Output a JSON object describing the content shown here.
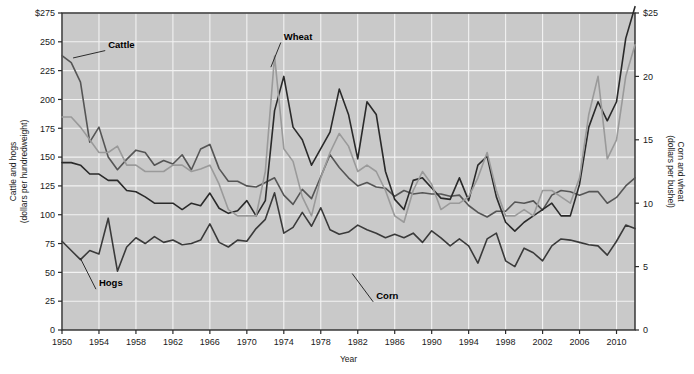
{
  "chart_data": {
    "type": "line",
    "title": "",
    "xlabel": "Year",
    "ylabel_left": "Cattle and hogs\n(dollars per hundredweight)",
    "ylabel_left_line1": "Cattle and hogs",
    "ylabel_left_line2": "(dollars per hundredweight)",
    "ylabel_right_line1": "Corn and wheat",
    "ylabel_right_line2": "(dollars per bushel)",
    "grid": true,
    "legend_position": "inline-annotations",
    "xlim": [
      1950,
      2012
    ],
    "x_ticks": [
      1950,
      1954,
      1958,
      1962,
      1966,
      1970,
      1974,
      1978,
      1982,
      1986,
      1990,
      1994,
      1998,
      2002,
      2006,
      2010
    ],
    "x_tick_labels": [
      "1950",
      "1954",
      "1958",
      "1962",
      "1966",
      "1970",
      "1974",
      "1978",
      "1982",
      "1986",
      "1990",
      "1994",
      "1998",
      "2002",
      "2006",
      "2010"
    ],
    "ylim_left": [
      0,
      275
    ],
    "y_ticks_left": [
      0,
      25,
      50,
      75,
      100,
      125,
      150,
      175,
      200,
      225,
      250,
      275
    ],
    "y_tick_labels_left": [
      "0",
      "25",
      "50",
      "75",
      "100",
      "125",
      "150",
      "175",
      "200",
      "225",
      "250",
      "$275"
    ],
    "ylim_right": [
      0,
      25
    ],
    "y_ticks_right": [
      0,
      5,
      10,
      15,
      20,
      25
    ],
    "y_tick_labels_right": [
      "0",
      "5",
      "10",
      "15",
      "20",
      "$25"
    ],
    "colors": {
      "background": "#c9c9c9",
      "gridline": "#f2f2f2",
      "frame": "#2b2b2b",
      "cattle": "#555555",
      "hogs": "#3a3a3a",
      "corn": "#2a2a2a",
      "wheat": "#9a9a9a"
    },
    "x": [
      1950,
      1951,
      1952,
      1953,
      1954,
      1955,
      1956,
      1957,
      1958,
      1959,
      1960,
      1961,
      1962,
      1963,
      1964,
      1965,
      1966,
      1967,
      1968,
      1969,
      1970,
      1971,
      1972,
      1973,
      1974,
      1975,
      1976,
      1977,
      1978,
      1979,
      1980,
      1981,
      1982,
      1983,
      1984,
      1985,
      1986,
      1987,
      1988,
      1989,
      1990,
      1991,
      1992,
      1993,
      1994,
      1995,
      1996,
      1997,
      1998,
      1999,
      2000,
      2001,
      2002,
      2003,
      2004,
      2005,
      2006,
      2007,
      2008,
      2009,
      2010,
      2011,
      2012
    ],
    "series": [
      {
        "name": "Cattle",
        "axis": "left",
        "color": "#555555",
        "label_x": 1955,
        "label_y": 245,
        "values": [
          238,
          232,
          215,
          163,
          176,
          150,
          139,
          148,
          156,
          154,
          143,
          147,
          144,
          152,
          139,
          157,
          161,
          140,
          129,
          129,
          125,
          124,
          128,
          132,
          117,
          109,
          122,
          114,
          133,
          152,
          141,
          132,
          125,
          128,
          124,
          123,
          116,
          121,
          118,
          119,
          118,
          118,
          116,
          117,
          108,
          102,
          98,
          103,
          103,
          111,
          110,
          112,
          104,
          117,
          121,
          120,
          117,
          120,
          120,
          110,
          115,
          125,
          132
        ]
      },
      {
        "name": "Hogs",
        "axis": "left",
        "color": "#3a3a3a",
        "label_x": 1954,
        "label_y": 38,
        "values": [
          77,
          69,
          61,
          69,
          66,
          97,
          51,
          72,
          80,
          75,
          81,
          76,
          78,
          74,
          75,
          78,
          92,
          76,
          72,
          78,
          77,
          88,
          96,
          119,
          84,
          89,
          102,
          90,
          106,
          87,
          83,
          85,
          91,
          87,
          84,
          80,
          83,
          80,
          84,
          76,
          86,
          80,
          73,
          79,
          73,
          58,
          79,
          84,
          60,
          55,
          71,
          67,
          60,
          73,
          79,
          78,
          76,
          74,
          73,
          65,
          77,
          91,
          88
        ]
      },
      {
        "name": "Corn",
        "axis": "right",
        "color": "#2a2a2a",
        "label_x": 1984,
        "label_y": 27,
        "values": [
          13.2,
          13.2,
          13.0,
          12.3,
          12.3,
          11.8,
          11.8,
          11.0,
          10.9,
          10.5,
          10.0,
          10.0,
          10.0,
          9.5,
          10.0,
          9.8,
          10.8,
          9.6,
          9.2,
          9.4,
          10.2,
          9.0,
          10.2,
          17.3,
          20.0,
          16.0,
          15.0,
          13.0,
          14.3,
          15.6,
          19.0,
          17.0,
          13.5,
          18.0,
          17.0,
          12.5,
          10.3,
          9.5,
          11.8,
          12.0,
          11.2,
          10.4,
          10.3,
          12.0,
          10.2,
          13.0,
          13.7,
          10.5,
          8.5,
          7.8,
          8.5,
          9.0,
          9.5,
          10.0,
          9.0,
          9.0,
          11.5,
          16.0,
          18.0,
          16.5,
          18.0,
          23.0,
          25.5
        ]
      },
      {
        "name": "Wheat",
        "axis": "right",
        "color": "#9a9a9a",
        "label_x": 1974,
        "label_y": 252,
        "values": [
          16.8,
          16.8,
          16.0,
          15.0,
          14.0,
          14.0,
          14.5,
          13.0,
          13.0,
          12.5,
          12.5,
          12.5,
          13.0,
          13.0,
          12.5,
          12.7,
          13.0,
          11.5,
          9.5,
          9.0,
          9.0,
          9.0,
          12.5,
          21.6,
          14.3,
          13.3,
          10.5,
          9.0,
          12.0,
          14.0,
          15.5,
          14.5,
          12.5,
          13.0,
          12.5,
          11.0,
          9.0,
          8.5,
          11.0,
          12.5,
          11.5,
          9.5,
          10.0,
          10.0,
          10.5,
          12.0,
          14.0,
          11.0,
          9.0,
          9.0,
          9.5,
          9.0,
          11.0,
          11.0,
          10.5,
          10.0,
          12.0,
          17.0,
          20.0,
          13.5,
          15.0,
          20.0,
          22.5
        ]
      }
    ]
  },
  "annotations": [
    {
      "name": "cattle-label",
      "text": "Cattle"
    },
    {
      "name": "hogs-label",
      "text": "Hogs"
    },
    {
      "name": "corn-label",
      "text": "Corn"
    },
    {
      "name": "wheat-label",
      "text": "Wheat"
    }
  ]
}
